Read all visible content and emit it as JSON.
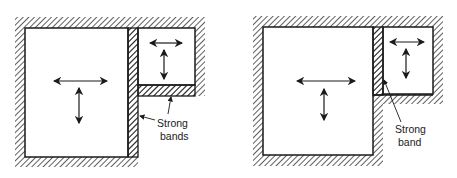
{
  "figures": [
    {
      "id": "left",
      "description": "Large room adjacent to smaller room with strong bands on the shared vertical wall and under the small room",
      "label": {
        "line1": "Strong",
        "line2": "bands"
      }
    },
    {
      "id": "right",
      "description": "Large room adjacent to smaller room with a strong band on the shared vertical wall",
      "label": {
        "line1": "Strong",
        "line2": "band"
      }
    }
  ],
  "colors": {
    "ink": "#1a1a1a",
    "background": "#ffffff"
  }
}
